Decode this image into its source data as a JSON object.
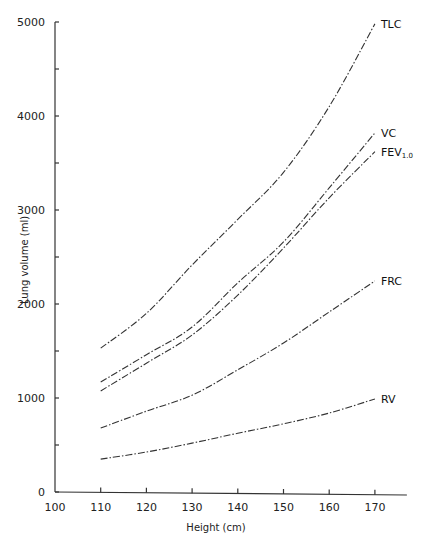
{
  "chart_data": {
    "type": "line",
    "title": "",
    "xlabel": "Height (cm)",
    "ylabel": "Lung volume (ml)",
    "xlim": [
      100,
      177
    ],
    "ylim": [
      0,
      5000
    ],
    "x_ticks": [
      100,
      110,
      120,
      130,
      140,
      150,
      160,
      170
    ],
    "y_ticks": [
      0,
      1000,
      2000,
      3000,
      4000,
      5000
    ],
    "y_minor_ticks": [
      500,
      1500,
      2500,
      3500,
      4500
    ],
    "grid": false,
    "legend": "inline labels at line ends",
    "x": [
      110,
      120,
      130,
      140,
      150,
      160,
      170
    ],
    "series": [
      {
        "name": "TLC",
        "label": "TLC",
        "values": [
          1530,
          1900,
          2415,
          2900,
          3400,
          4100,
          4980
        ]
      },
      {
        "name": "VC",
        "label": "VC",
        "values": [
          1170,
          1460,
          1755,
          2225,
          2660,
          3235,
          3820
        ]
      },
      {
        "name": "FEV1.0",
        "label": "FEV",
        "subscript": "1.0",
        "values": [
          1075,
          1370,
          1670,
          2095,
          2595,
          3130,
          3620
        ]
      },
      {
        "name": "FRC",
        "label": "FRC",
        "values": [
          680,
          860,
          1030,
          1300,
          1585,
          1915,
          2245
        ]
      },
      {
        "name": "RV",
        "label": "RV",
        "values": [
          350,
          425,
          520,
          625,
          725,
          840,
          990
        ]
      }
    ]
  }
}
